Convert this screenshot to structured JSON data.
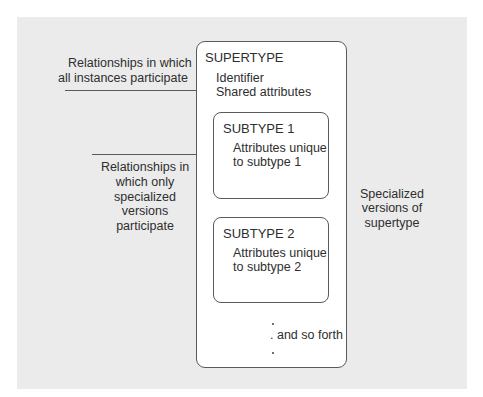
{
  "supertype": {
    "title": "SUPERTYPE",
    "attr1": "Identifier",
    "attr2": "Shared attributes"
  },
  "subtype1": {
    "title": "SUBTYPE 1",
    "line1": "Attributes unique",
    "line2": "to subtype 1"
  },
  "subtype2": {
    "title": "SUBTYPE 2",
    "line1": "Attributes unique",
    "line2": "to subtype 2"
  },
  "more": ". and so forth",
  "labels": {
    "all_relationships": [
      "Relationships in which",
      "all instances participate"
    ],
    "specialized_relationships": [
      "Relationships in",
      "which only",
      "specialized",
      "versions",
      "participate"
    ],
    "specialized_versions": [
      "Specialized",
      "versions of",
      "supertype"
    ]
  },
  "colors": {
    "background": "#ebebeb",
    "box_fill": "#ffffff",
    "stroke": "#5a5a5a",
    "text": "#2e2e2e"
  }
}
